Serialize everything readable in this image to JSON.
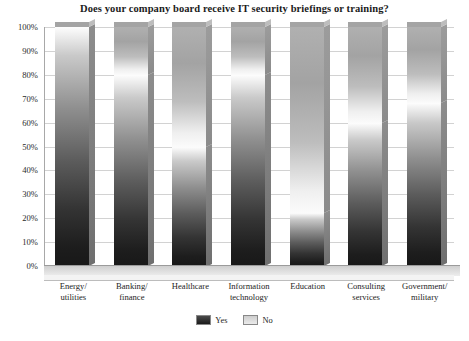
{
  "chart_data": {
    "type": "bar",
    "title": "Does your company board receive IT security briefings or training?",
    "xlabel": "",
    "ylabel": "",
    "ylim": [
      0,
      100
    ],
    "ytick_labels": [
      "100%",
      "90%",
      "80%",
      "70%",
      "60%",
      "50%",
      "40%",
      "30%",
      "20%",
      "10%",
      "0%"
    ],
    "ytick_values": [
      100,
      90,
      80,
      70,
      60,
      50,
      40,
      30,
      20,
      10,
      0
    ],
    "grid": true,
    "stacked": true,
    "legend_position": "bottom-center",
    "categories": [
      "Energy/ utilities",
      "Banking/ finance",
      "Healthcare",
      "Information technology",
      "Education",
      "Consulting services",
      "Government/ military"
    ],
    "category_lines": [
      [
        "Energy/",
        "utilities"
      ],
      [
        "Banking/",
        "finance"
      ],
      [
        "Healthcare"
      ],
      [
        "Information",
        "technology"
      ],
      [
        "Education"
      ],
      [
        "Consulting",
        "services"
      ],
      [
        "Government/",
        "military"
      ]
    ],
    "series": [
      {
        "name": "Yes",
        "color": "#1d1d1d",
        "values": [
          100,
          80,
          50,
          80,
          22,
          60,
          68
        ]
      },
      {
        "name": "No",
        "color": "#cfcfcf",
        "values": [
          0,
          20,
          50,
          20,
          78,
          40,
          32
        ]
      }
    ]
  },
  "legend": {
    "items": [
      {
        "label": "Yes"
      },
      {
        "label": "No"
      }
    ]
  },
  "colors": {
    "background": "#ffffff",
    "gridline": "#d2d2d2",
    "axis": "#a8a8a8",
    "text": "#1b1b1b",
    "bar_yes_dark": "#181818",
    "bar_yes_light": "#fdfdfd",
    "bar_no": "#b0b0b0",
    "floor": "#cfcfcf"
  }
}
